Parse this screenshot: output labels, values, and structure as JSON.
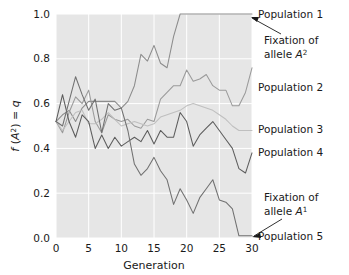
{
  "chart_data": {
    "type": "line",
    "title": "",
    "xlabel": "Generation",
    "ylabel": "f (A2) = q",
    "ylabel_plain": "f (A²) = q",
    "xlim": [
      0,
      30
    ],
    "ylim": [
      0.0,
      1.0
    ],
    "xticks": [
      0,
      5,
      10,
      15,
      20,
      25,
      30
    ],
    "xtick_labels": [
      "0",
      "5",
      "10",
      "15",
      "20",
      "25",
      "30"
    ],
    "yticks": [
      0.0,
      0.2,
      0.4,
      0.6,
      0.8,
      1.0
    ],
    "ytick_labels": [
      "0.0",
      "0.2",
      "0.4",
      "0.6",
      "0.8",
      "1.0"
    ],
    "grid": true,
    "grid_color": "#ffffff",
    "plot_background": "#e6e6e6",
    "legend_position": "right-inline-labels",
    "x": [
      0,
      1,
      2,
      3,
      4,
      5,
      6,
      7,
      8,
      9,
      10,
      11,
      12,
      13,
      14,
      15,
      16,
      17,
      18,
      19,
      20,
      21,
      22,
      23,
      24,
      25,
      26,
      27,
      28,
      29,
      30
    ],
    "series": [
      {
        "name": "Population 1",
        "color": "#8c8c8c",
        "label": "Population 1",
        "values": [
          0.52,
          0.55,
          0.57,
          0.52,
          0.58,
          0.61,
          0.61,
          0.61,
          0.61,
          0.61,
          0.58,
          0.61,
          0.68,
          0.82,
          0.79,
          0.86,
          0.78,
          0.76,
          0.9,
          1.0,
          1.0,
          1.0,
          1.0,
          1.0,
          1.0,
          1.0,
          1.0,
          1.0,
          1.0,
          1.0,
          1.0
        ]
      },
      {
        "name": "Population 2",
        "color": "#9a9a9a",
        "label": "Population 2",
        "values": [
          0.52,
          0.47,
          0.56,
          0.63,
          0.6,
          0.66,
          0.52,
          0.47,
          0.55,
          0.53,
          0.52,
          0.53,
          0.5,
          0.49,
          0.53,
          0.52,
          0.62,
          0.65,
          0.68,
          0.68,
          0.75,
          0.7,
          0.71,
          0.73,
          0.68,
          0.66,
          0.66,
          0.59,
          0.59,
          0.65,
          0.76
        ]
      },
      {
        "name": "Population 3",
        "color": "#bfbfbf",
        "label": "Population 3",
        "values": [
          0.52,
          0.48,
          0.52,
          0.56,
          0.57,
          0.51,
          0.51,
          0.53,
          0.56,
          0.53,
          0.5,
          0.51,
          0.52,
          0.51,
          0.5,
          0.51,
          0.54,
          0.55,
          0.56,
          0.57,
          0.59,
          0.6,
          0.59,
          0.58,
          0.57,
          0.55,
          0.53,
          0.5,
          0.48,
          0.48,
          0.48
        ]
      },
      {
        "name": "Population 4",
        "color": "#5c5c5c",
        "label": "Population 4",
        "values": [
          0.52,
          0.64,
          0.52,
          0.45,
          0.55,
          0.52,
          0.4,
          0.46,
          0.4,
          0.45,
          0.41,
          0.43,
          0.45,
          0.43,
          0.48,
          0.42,
          0.48,
          0.45,
          0.45,
          0.56,
          0.52,
          0.41,
          0.46,
          0.49,
          0.52,
          0.48,
          0.44,
          0.4,
          0.31,
          0.29,
          0.38
        ]
      },
      {
        "name": "Population 5",
        "color": "#707070",
        "label": "Population 5",
        "values": [
          0.52,
          0.5,
          0.61,
          0.72,
          0.64,
          0.57,
          0.62,
          0.47,
          0.6,
          0.57,
          0.58,
          0.48,
          0.33,
          0.28,
          0.31,
          0.36,
          0.3,
          0.26,
          0.15,
          0.22,
          0.17,
          0.11,
          0.18,
          0.22,
          0.26,
          0.17,
          0.16,
          0.13,
          0.01,
          0.01,
          0.01
        ]
      }
    ],
    "annotations": [
      {
        "name": "fixation-a2",
        "line1": "Fixation of",
        "line2_prefix": "allele ",
        "line2_italic": "A",
        "line2_sup": "2",
        "target_series": "Population 1"
      },
      {
        "name": "fixation-a1",
        "line1": "Fixation of",
        "line2_prefix": "allele ",
        "line2_italic": "A",
        "line2_sup": "1",
        "target_series": "Population 5"
      }
    ]
  },
  "labels": {
    "pop1": "Population 1",
    "pop2": "Population 2",
    "pop3": "Population 3",
    "pop4": "Population 4",
    "pop5": "Population 5",
    "fixation_line1_a2": "Fixation of",
    "fixation_line2_a2_prefix": "allele ",
    "fixation_line2_a2_italic": "A",
    "fixation_line2_a2_sup": "2",
    "fixation_line1_a1": "Fixation of",
    "fixation_line2_a1_prefix": "allele ",
    "fixation_line2_a1_italic": "A",
    "fixation_line2_a1_sup": "1",
    "xaxis_title": "Generation",
    "yaxis_f": "f",
    "yaxis_open": " (",
    "yaxis_A": "A",
    "yaxis_sup": "2",
    "yaxis_close": ") = ",
    "yaxis_q": "q",
    "ytick_0": "0.0",
    "ytick_1": "0.2",
    "ytick_2": "0.4",
    "ytick_3": "0.6",
    "ytick_4": "0.8",
    "ytick_5": "1.0",
    "xtick_0": "0",
    "xtick_1": "5",
    "xtick_2": "10",
    "xtick_3": "15",
    "xtick_4": "20",
    "xtick_5": "25",
    "xtick_6": "30"
  }
}
